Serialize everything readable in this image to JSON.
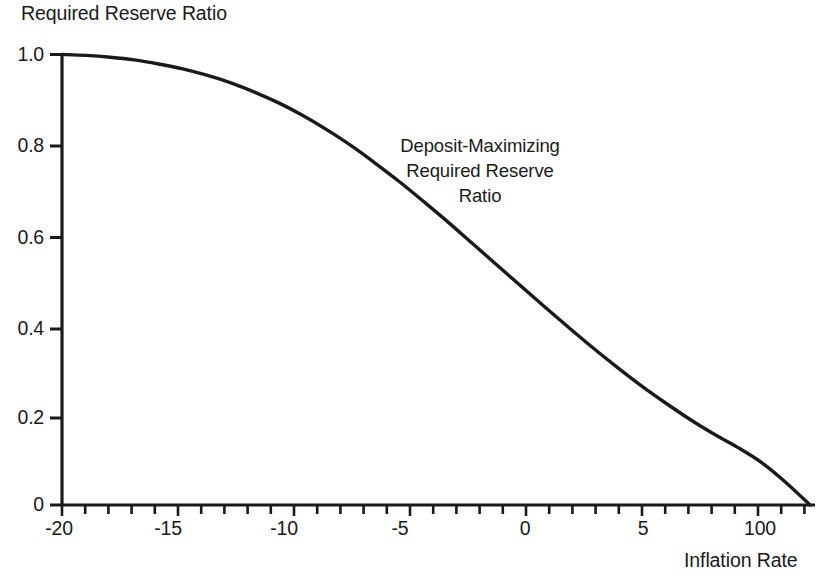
{
  "chart_data": {
    "type": "line",
    "title": "Required Reserve Ratio",
    "xlabel": "Inflation Rate",
    "ylabel": "Required Reserve Ratio",
    "grid": false,
    "legend": "none",
    "xlim": [
      -20,
      11
    ],
    "ylim": [
      0,
      1.0
    ],
    "xticks": [
      -20,
      -15,
      -10,
      -5,
      0,
      5,
      100
    ],
    "xtick_labels": [
      "-20",
      "-15",
      "-10",
      "-5",
      "0",
      "5",
      "100"
    ],
    "yticks": [
      0,
      0.2,
      0.4,
      0.6,
      0.8,
      1.0
    ],
    "ytick_labels": [
      "0",
      "0.2",
      "0.4",
      "0.6",
      "0.8",
      "1.0"
    ],
    "minor_xticks": true,
    "series": [
      {
        "name": "Deposit-Maximizing Required Reserve Ratio",
        "x": [
          -20,
          -19,
          -18,
          -17,
          -16,
          -15,
          -14,
          -13,
          -12,
          -11,
          -10,
          -9,
          -8,
          -7,
          -6,
          -5,
          -4,
          -3,
          -2,
          -1,
          0,
          1,
          2,
          3,
          4,
          5,
          6,
          7,
          8,
          9,
          10,
          11
        ],
        "y": [
          1.0,
          0.998,
          0.994,
          0.988,
          0.979,
          0.968,
          0.954,
          0.937,
          0.916,
          0.892,
          0.864,
          0.832,
          0.797,
          0.758,
          0.717,
          0.673,
          0.628,
          0.581,
          0.534,
          0.487,
          0.44,
          0.394,
          0.349,
          0.306,
          0.265,
          0.227,
          0.191,
          0.158,
          0.128,
          0.094,
          0.05,
          0.0
        ]
      }
    ],
    "annotations": [
      {
        "name": "curve-label",
        "lines": [
          "Deposit-Maximizing",
          "Required Reserve",
          "Ratio"
        ],
        "x": 480,
        "y": 175
      }
    ],
    "colors": {
      "curve": "#1a1a1a",
      "axis": "#1a1a1a",
      "background": "#ffffff",
      "text": "#1a1a1a"
    }
  }
}
